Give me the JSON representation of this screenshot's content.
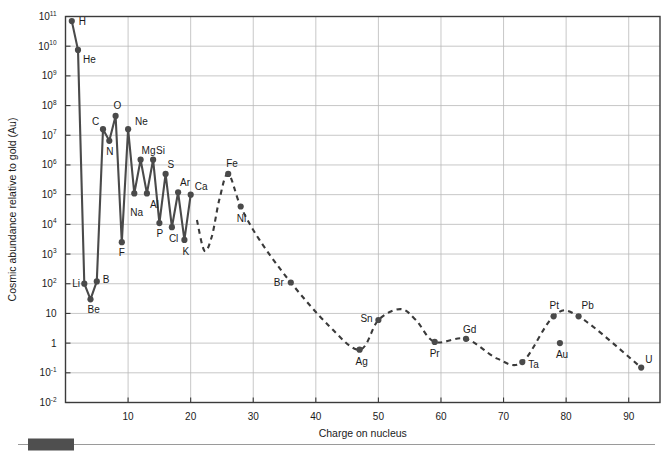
{
  "chart_data": {
    "type": "scatter",
    "title": "",
    "xlabel": "Charge on nucleus",
    "ylabel": "Cosmic abundance relative to gold (Au)",
    "xlim": [
      0,
      95
    ],
    "ylim": [
      0.01,
      100000000000
    ],
    "yscale": "log",
    "xticks": [
      10,
      20,
      30,
      40,
      50,
      60,
      70,
      80,
      90
    ],
    "xtick_labels": [
      "10",
      "20",
      "30",
      "40",
      "50",
      "60",
      "70",
      "80",
      "90"
    ],
    "ytick_labels": [
      {
        "mantissa": "10",
        "exp": "11"
      },
      {
        "mantissa": "10",
        "exp": "10"
      },
      {
        "mantissa": "10",
        "exp": "9"
      },
      {
        "mantissa": "10",
        "exp": "8"
      },
      {
        "mantissa": "10",
        "exp": "7"
      },
      {
        "mantissa": "10",
        "exp": "6"
      },
      {
        "mantissa": "10",
        "exp": "5"
      },
      {
        "mantissa": "10",
        "exp": "4"
      },
      {
        "mantissa": "10",
        "exp": "3"
      },
      {
        "mantissa": "10",
        "exp": "2"
      },
      {
        "mantissa": "10",
        "exp": ""
      },
      {
        "mantissa": "1",
        "exp": ""
      },
      {
        "mantissa": "10",
        "exp": "-1"
      },
      {
        "mantissa": "10",
        "exp": "-2"
      }
    ],
    "ytick_values": [
      100000000000.0,
      10000000000.0,
      1000000000.0,
      100000000.0,
      10000000.0,
      1000000.0,
      100000.0,
      10000.0,
      1000.0,
      100.0,
      10,
      1,
      0.1,
      0.01
    ],
    "grid": true,
    "legend": "none",
    "series": [
      {
        "name": "Light elements (solid line)",
        "style": "solid",
        "points": [
          {
            "label": "H",
            "z": 1,
            "value": 70000000000.0,
            "label_dx": 7,
            "label_dy": 4
          },
          {
            "label": "He",
            "z": 2,
            "value": 7500000000.0,
            "label_dx": 5,
            "label_dy": 13
          },
          {
            "label": "Li",
            "z": 3,
            "value": 100.0,
            "label_dx": -12,
            "label_dy": 3
          },
          {
            "label": "Be",
            "z": 4,
            "value": 30.0,
            "label_dx": -3,
            "label_dy": 14
          },
          {
            "label": "B",
            "z": 5,
            "value": 120.0,
            "label_dx": 6,
            "label_dy": 2
          },
          {
            "label": "C",
            "z": 6,
            "value": 16000000.0,
            "label_dx": -11,
            "label_dy": -4
          },
          {
            "label": "N",
            "z": 7,
            "value": 6500000.0,
            "label_dx": -3,
            "label_dy": 14
          },
          {
            "label": "O",
            "z": 8,
            "value": 45000000.0,
            "label_dx": -2,
            "label_dy": -7
          },
          {
            "label": "F",
            "z": 9,
            "value": 2500.0,
            "label_dx": -3,
            "label_dy": 14
          },
          {
            "label": "Ne",
            "z": 10,
            "value": 16000000.0,
            "label_dx": 7,
            "label_dy": -4
          },
          {
            "label": "Na",
            "z": 11,
            "value": 110000.0,
            "label_dx": -4,
            "label_dy": 23
          },
          {
            "label": "Mg",
            "z": 12,
            "value": 1500000.0,
            "label_dx": 1,
            "label_dy": -6
          },
          {
            "label": "Al",
            "z": 13,
            "value": 110000.0,
            "label_dx": 3,
            "label_dy": 15
          },
          {
            "label": "Si",
            "z": 14,
            "value": 1500000.0,
            "label_dx": 3,
            "label_dy": -6
          },
          {
            "label": "P",
            "z": 15,
            "value": 11000.0,
            "label_dx": -3,
            "label_dy": 14
          },
          {
            "label": "S",
            "z": 16,
            "value": 500000.0,
            "label_dx": 2,
            "label_dy": -6
          },
          {
            "label": "Cl",
            "z": 17,
            "value": 8000.0,
            "label_dx": -3,
            "label_dy": 15
          },
          {
            "label": "Ar",
            "z": 18,
            "value": 120000.0,
            "label_dx": 2,
            "label_dy": -6
          },
          {
            "label": "K",
            "z": 19,
            "value": 3000.0,
            "label_dx": -2,
            "label_dy": 15
          },
          {
            "label": "Ca",
            "z": 20,
            "value": 100000.0,
            "label_dx": 4,
            "label_dy": -5
          }
        ]
      },
      {
        "name": "Heavy elements (dashed trend)",
        "style": "dashed",
        "points": [
          {
            "label": "Fe",
            "z": 26,
            "value": 500000.0,
            "label_dx": -2,
            "label_dy": -7
          },
          {
            "label": "Ni",
            "z": 28,
            "value": 40000.0,
            "label_dx": -4,
            "label_dy": 15
          },
          {
            "label": "Br",
            "z": 36,
            "value": 110.0,
            "label_dx": -17,
            "label_dy": 3
          },
          {
            "label": "Ag",
            "z": 47,
            "value": 0.6,
            "label_dx": -4,
            "label_dy": 15
          },
          {
            "label": "Sn",
            "z": 50,
            "value": 6.0,
            "label_dx": -18,
            "label_dy": 2
          },
          {
            "label": "Pr",
            "z": 59,
            "value": 1.1,
            "label_dx": -5,
            "label_dy": 15
          },
          {
            "label": "Gd",
            "z": 64,
            "value": 1.4,
            "label_dx": -3,
            "label_dy": -6
          },
          {
            "label": "Ta",
            "z": 73,
            "value": 0.23,
            "label_dx": 6,
            "label_dy": 6
          },
          {
            "label": "Pt",
            "z": 78,
            "value": 8.0,
            "label_dx": -4,
            "label_dy": -7
          },
          {
            "label": "Au",
            "z": 79,
            "value": 1.0,
            "label_dx": -4,
            "label_dy": 15
          },
          {
            "label": "Pb",
            "z": 82,
            "value": 8.0,
            "label_dx": 3,
            "label_dy": -7
          },
          {
            "label": "U",
            "z": 92,
            "value": 0.15,
            "label_dx": 4,
            "label_dy": -5
          }
        ],
        "trend_path": [
          {
            "z": 21.0,
            "value": 14000.0
          },
          {
            "z": 22.2,
            "value": 1300.0
          },
          {
            "z": 23.4,
            "value": 4000.0
          },
          {
            "z": 24.6,
            "value": 70000.0
          },
          {
            "z": 26.0,
            "value": 500000.0
          },
          {
            "z": 28.0,
            "value": 40000.0
          },
          {
            "z": 31.0,
            "value": 3000.0
          },
          {
            "z": 36.0,
            "value": 110.0
          },
          {
            "z": 42.0,
            "value": 4.0
          },
          {
            "z": 47.0,
            "value": 0.6
          },
          {
            "z": 50.0,
            "value": 6.0
          },
          {
            "z": 53.5,
            "value": 14.0
          },
          {
            "z": 56.0,
            "value": 6.0
          },
          {
            "z": 59.0,
            "value": 1.1
          },
          {
            "z": 64.0,
            "value": 1.4
          },
          {
            "z": 69.0,
            "value": 0.3
          },
          {
            "z": 73.0,
            "value": 0.23
          },
          {
            "z": 78.0,
            "value": 8.0
          },
          {
            "z": 82.0,
            "value": 8.0
          },
          {
            "z": 92.0,
            "value": 0.15
          }
        ]
      }
    ]
  },
  "scrollbar": {
    "name": "horizontal-scrollbar"
  }
}
